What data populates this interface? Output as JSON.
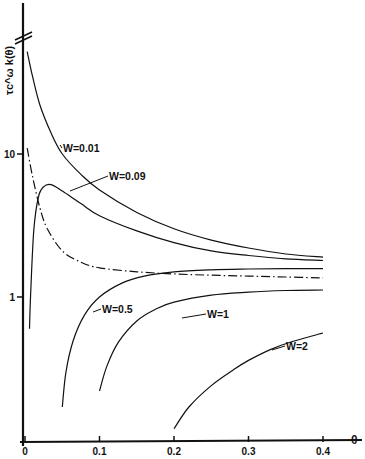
{
  "chart_data": {
    "type": "line",
    "title": "",
    "xlabel": "θ",
    "ylabel": "τc^ω k(θ)",
    "x_scale": "linear",
    "y_scale": "log",
    "xlim": [
      0,
      0.45
    ],
    "ylim": [
      0.1,
      60
    ],
    "x_ticks": [
      "0",
      "0.1",
      "0.2",
      "0.3",
      "0.4"
    ],
    "y_ticks": [
      "1",
      "10"
    ],
    "y_axis_break": true,
    "grid": false,
    "legend": "inline curve labels",
    "series": [
      {
        "name": "W=0.01",
        "label": "W=0.01",
        "style": "solid",
        "x": [
          0.003,
          0.01,
          0.02,
          0.035,
          0.05,
          0.075,
          0.1,
          0.15,
          0.2,
          0.25,
          0.3,
          0.35,
          0.4
        ],
        "y": [
          52,
          35,
          22,
          14,
          10,
          7.2,
          5.6,
          3.9,
          3.0,
          2.5,
          2.2,
          2.0,
          1.9
        ]
      },
      {
        "name": "W=0.09",
        "label": "W=0.09",
        "style": "solid",
        "x": [
          0.006,
          0.008,
          0.012,
          0.018,
          0.025,
          0.035,
          0.05,
          0.075,
          0.1,
          0.15,
          0.2,
          0.25,
          0.3,
          0.35,
          0.4
        ],
        "y": [
          0.6,
          1.2,
          3.0,
          5.0,
          5.9,
          6.1,
          5.5,
          4.5,
          3.7,
          2.9,
          2.4,
          2.1,
          1.95,
          1.85,
          1.8
        ]
      },
      {
        "name": "limit (dash-dot)",
        "label": "",
        "style": "dashdot",
        "x": [
          0.003,
          0.01,
          0.02,
          0.03,
          0.05,
          0.075,
          0.1,
          0.15,
          0.2,
          0.25,
          0.3,
          0.35,
          0.4
        ],
        "y": [
          11,
          7.0,
          4.2,
          3.0,
          2.1,
          1.75,
          1.6,
          1.5,
          1.45,
          1.42,
          1.4,
          1.38,
          1.36
        ]
      },
      {
        "name": "W=0.5",
        "label": "W=0.5",
        "style": "solid",
        "x": [
          0.05,
          0.055,
          0.065,
          0.08,
          0.1,
          0.13,
          0.16,
          0.2,
          0.25,
          0.3,
          0.35,
          0.4
        ],
        "y": [
          0.17,
          0.3,
          0.5,
          0.75,
          1.0,
          1.25,
          1.4,
          1.5,
          1.55,
          1.57,
          1.58,
          1.58
        ]
      },
      {
        "name": "W=1",
        "label": "W=1",
        "style": "solid",
        "x": [
          0.1,
          0.11,
          0.125,
          0.15,
          0.175,
          0.2,
          0.25,
          0.3,
          0.35,
          0.4
        ],
        "y": [
          0.22,
          0.33,
          0.48,
          0.68,
          0.82,
          0.92,
          1.03,
          1.08,
          1.11,
          1.12
        ]
      },
      {
        "name": "W=2",
        "label": "W=2",
        "style": "solid",
        "x": [
          0.2,
          0.22,
          0.25,
          0.28,
          0.3,
          0.33,
          0.36,
          0.4
        ],
        "y": [
          0.12,
          0.17,
          0.24,
          0.31,
          0.36,
          0.43,
          0.49,
          0.56
        ]
      }
    ]
  }
}
